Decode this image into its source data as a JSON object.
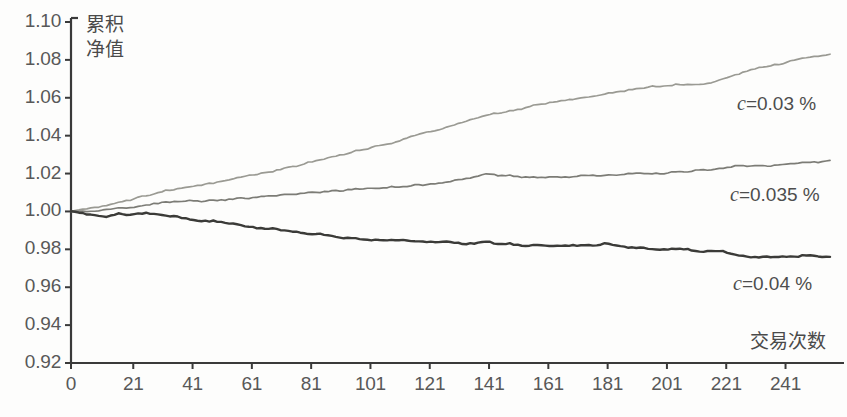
{
  "chart_data": {
    "type": "line",
    "title": "",
    "xlabel": "交易次数",
    "ylabel": "累积\n净值",
    "ylabel_line1": "累积",
    "ylabel_line2": "净值",
    "xlim": [
      0,
      256
    ],
    "ylim": [
      0.92,
      1.1
    ],
    "grid": false,
    "legend_position": "inline-right",
    "x_ticks": [
      0,
      21,
      41,
      61,
      81,
      101,
      121,
      141,
      161,
      181,
      201,
      221,
      241
    ],
    "y_ticks": [
      0.92,
      0.94,
      0.96,
      0.98,
      1.0,
      1.02,
      1.04,
      1.06,
      1.08,
      1.1
    ],
    "x_tick_labels": [
      "0",
      "21",
      "41",
      "61",
      "81",
      "101",
      "121",
      "141",
      "161",
      "181",
      "201",
      "221",
      "241"
    ],
    "y_tick_labels": [
      "0.92",
      "0.94",
      "0.96",
      "0.98",
      "1.00",
      "1.02",
      "1.04",
      "1.06",
      "1.08",
      "1.10"
    ],
    "series": [
      {
        "name": "c=0.03 %",
        "label_prefix": "c",
        "label_suffix": "=0.03 %",
        "color": "#9a9a93",
        "x": [
          0,
          4,
          8,
          12,
          16,
          20,
          24,
          28,
          32,
          36,
          40,
          44,
          48,
          52,
          56,
          60,
          64,
          68,
          72,
          76,
          80,
          84,
          88,
          92,
          96,
          100,
          104,
          108,
          112,
          116,
          120,
          124,
          128,
          132,
          136,
          140,
          144,
          148,
          152,
          156,
          160,
          164,
          168,
          172,
          176,
          180,
          184,
          188,
          192,
          196,
          200,
          204,
          208,
          212,
          216,
          220,
          224,
          228,
          232,
          236,
          240,
          244,
          248,
          252,
          256
        ],
        "values": [
          1.0,
          1.001,
          1.002,
          1.003,
          1.005,
          1.006,
          1.008,
          1.009,
          1.011,
          1.012,
          1.013,
          1.014,
          1.015,
          1.016,
          1.018,
          1.019,
          1.02,
          1.021,
          1.023,
          1.024,
          1.026,
          1.027,
          1.029,
          1.03,
          1.032,
          1.033,
          1.035,
          1.036,
          1.038,
          1.04,
          1.042,
          1.043,
          1.045,
          1.047,
          1.049,
          1.051,
          1.052,
          1.053,
          1.054,
          1.056,
          1.057,
          1.058,
          1.059,
          1.06,
          1.061,
          1.062,
          1.063,
          1.064,
          1.065,
          1.066,
          1.066,
          1.067,
          1.067,
          1.067,
          1.068,
          1.07,
          1.072,
          1.074,
          1.076,
          1.077,
          1.078,
          1.08,
          1.081,
          1.082,
          1.083
        ]
      },
      {
        "name": "c=0.035 %",
        "label_prefix": "c",
        "label_suffix": "=0.035 %",
        "color": "#7c7c76",
        "x": [
          0,
          4,
          8,
          12,
          16,
          20,
          24,
          28,
          32,
          36,
          40,
          44,
          48,
          52,
          56,
          60,
          64,
          68,
          72,
          76,
          80,
          84,
          88,
          92,
          96,
          100,
          104,
          108,
          112,
          116,
          120,
          124,
          128,
          132,
          136,
          140,
          144,
          148,
          152,
          156,
          160,
          164,
          168,
          172,
          176,
          180,
          184,
          188,
          192,
          196,
          200,
          204,
          208,
          212,
          216,
          220,
          224,
          228,
          232,
          236,
          240,
          244,
          248,
          252,
          256
        ],
        "values": [
          1.0,
          1.0,
          1.0,
          1.001,
          1.002,
          1.002,
          1.003,
          1.004,
          1.005,
          1.005,
          1.006,
          1.005,
          1.006,
          1.006,
          1.007,
          1.007,
          1.008,
          1.008,
          1.009,
          1.009,
          1.01,
          1.01,
          1.011,
          1.011,
          1.012,
          1.012,
          1.012,
          1.013,
          1.013,
          1.014,
          1.014,
          1.015,
          1.016,
          1.017,
          1.018,
          1.02,
          1.019,
          1.019,
          1.018,
          1.018,
          1.018,
          1.018,
          1.018,
          1.019,
          1.019,
          1.019,
          1.019,
          1.02,
          1.02,
          1.02,
          1.02,
          1.021,
          1.021,
          1.022,
          1.022,
          1.023,
          1.024,
          1.024,
          1.024,
          1.024,
          1.025,
          1.025,
          1.026,
          1.026,
          1.027
        ]
      },
      {
        "name": "c=0.04 %",
        "label_prefix": "c",
        "label_suffix": "=0.04 %",
        "color": "#3b3b38",
        "x": [
          0,
          4,
          8,
          12,
          16,
          20,
          24,
          28,
          32,
          36,
          40,
          44,
          48,
          52,
          56,
          60,
          64,
          68,
          72,
          76,
          80,
          84,
          88,
          92,
          96,
          100,
          104,
          108,
          112,
          116,
          120,
          124,
          128,
          132,
          136,
          140,
          144,
          148,
          152,
          156,
          160,
          164,
          168,
          172,
          176,
          180,
          184,
          188,
          192,
          196,
          200,
          204,
          208,
          212,
          216,
          220,
          224,
          228,
          232,
          236,
          240,
          244,
          248,
          252,
          256
        ],
        "values": [
          1.0,
          0.999,
          0.998,
          0.997,
          0.999,
          0.998,
          0.999,
          0.999,
          0.998,
          0.997,
          0.996,
          0.995,
          0.995,
          0.994,
          0.993,
          0.992,
          0.991,
          0.991,
          0.99,
          0.989,
          0.988,
          0.988,
          0.987,
          0.986,
          0.986,
          0.985,
          0.985,
          0.985,
          0.985,
          0.984,
          0.984,
          0.984,
          0.984,
          0.983,
          0.983,
          0.984,
          0.983,
          0.983,
          0.982,
          0.982,
          0.982,
          0.982,
          0.982,
          0.982,
          0.982,
          0.983,
          0.982,
          0.981,
          0.981,
          0.98,
          0.98,
          0.98,
          0.98,
          0.979,
          0.979,
          0.979,
          0.977,
          0.976,
          0.976,
          0.976,
          0.976,
          0.976,
          0.977,
          0.976,
          0.976
        ]
      }
    ]
  },
  "axes": {
    "axis_color": "#3a3a3a",
    "tick_color": "#3a3a3a",
    "label_color": "#585858"
  }
}
